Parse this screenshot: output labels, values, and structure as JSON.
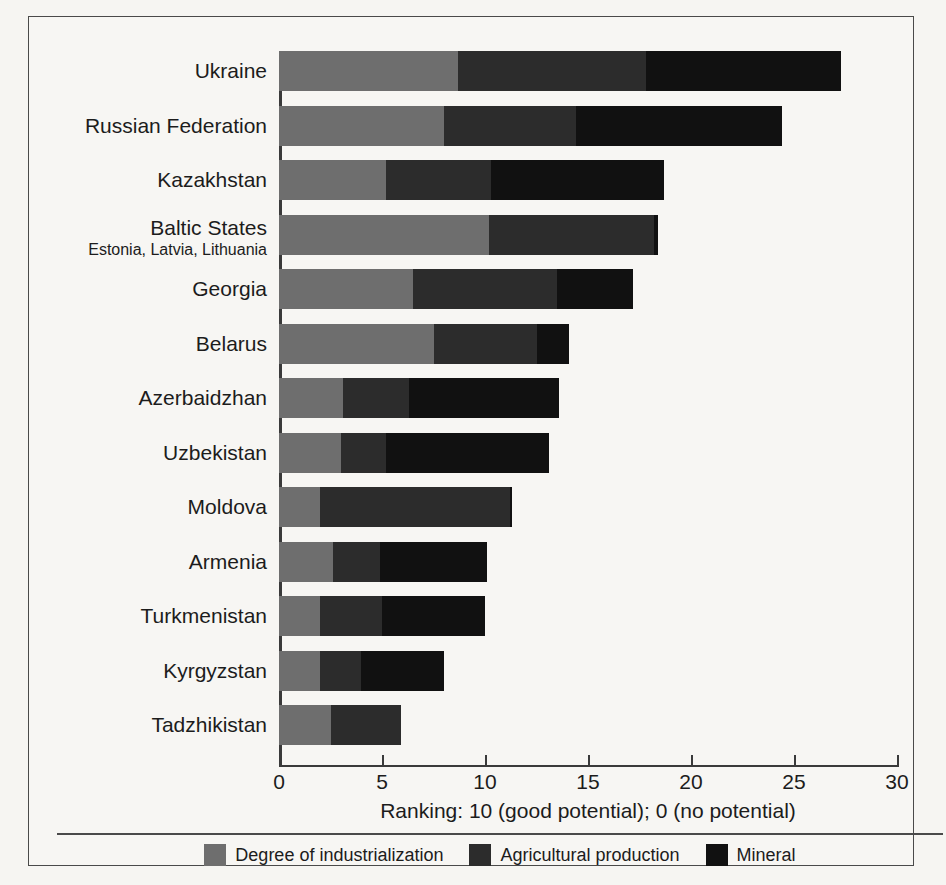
{
  "chart_data": {
    "type": "bar",
    "orientation": "horizontal",
    "stacked": true,
    "title": "",
    "xlabel": "Ranking: 10 (good potential); 0 (no potential)",
    "ylabel": "",
    "xlim": [
      0,
      30
    ],
    "xticks": [
      0,
      5,
      10,
      15,
      20,
      25,
      30
    ],
    "xticklabels": [
      "0",
      "5",
      "10",
      "15",
      "20",
      "25",
      "30"
    ],
    "grid": false,
    "legend_position": "bottom",
    "categories": [
      "Ukraine",
      "Russian Federation",
      "Kazakhstan",
      "Baltic States",
      "Georgia",
      "Belarus",
      "Azerbaidzhan",
      "Uzbekistan",
      "Moldova",
      "Armenia",
      "Turkmenistan",
      "Kyrgyzstan",
      "Tadzhikistan"
    ],
    "category_sublabels": [
      "",
      "",
      "",
      "Estonia, Latvia, Lithuania",
      "",
      "",
      "",
      "",
      "",
      "",
      "",
      "",
      ""
    ],
    "series": [
      {
        "name": "Degree of industrialization",
        "color": "#6e6e6e",
        "values": [
          8.7,
          8.0,
          5.2,
          10.2,
          6.5,
          7.5,
          3.1,
          3.0,
          2.0,
          2.6,
          2.0,
          2.0,
          2.5
        ]
      },
      {
        "name": "Agricultural production",
        "color": "#2c2c2c",
        "values": [
          9.1,
          6.4,
          5.1,
          8.0,
          7.0,
          5.0,
          3.2,
          2.2,
          9.2,
          2.3,
          3.0,
          2.0,
          3.4
        ]
      },
      {
        "name": "Mineral",
        "color": "#111111",
        "values": [
          9.5,
          10.0,
          8.4,
          0.2,
          3.7,
          1.6,
          7.3,
          7.9,
          0.1,
          5.2,
          5.0,
          4.0,
          0.0
        ]
      }
    ],
    "totals": [
      27.3,
      24.4,
      18.7,
      18.4,
      17.2,
      14.1,
      13.6,
      13.1,
      11.3,
      10.1,
      10.0,
      8.0,
      5.9
    ]
  },
  "legend": {
    "items": [
      {
        "label": "Degree of industrialization",
        "color": "#6e6e6e"
      },
      {
        "label": "Agricultural production",
        "color": "#2c2c2c"
      },
      {
        "label": "Mineral",
        "color": "#111111"
      }
    ]
  },
  "colors": {
    "industrialization": "#6e6e6e",
    "agriculture": "#2c2c2c",
    "mineral": "#111111",
    "axis": "#3a3a3a",
    "frame": "#4a4a4a",
    "background": "#f7f6f3",
    "text": "#1c1c1c"
  }
}
